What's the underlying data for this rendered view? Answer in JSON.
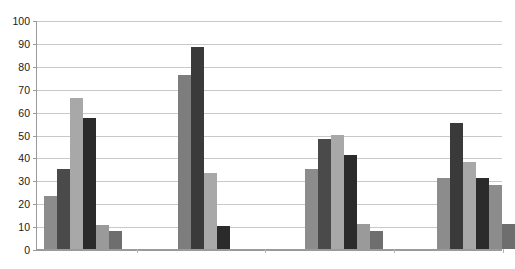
{
  "chart_data": {
    "type": "bar",
    "title": "",
    "subtitle": "",
    "xlabel": "",
    "ylabel": "",
    "ylim": [
      0,
      100
    ],
    "ytick_labels": [
      "100",
      "90",
      "80",
      "70",
      "60",
      "50",
      "40",
      "30",
      "20",
      "10",
      "0"
    ],
    "ytick_values": [
      100,
      90,
      80,
      70,
      60,
      50,
      40,
      30,
      20,
      10,
      0
    ],
    "grid": true,
    "legend": false,
    "legend_position": "none",
    "categories": [
      "Group 1",
      "Group 2",
      "Group 3",
      "Group 4"
    ],
    "xtick_labels": [
      "",
      "",
      "",
      ""
    ],
    "series": [
      {
        "name": "Series 1",
        "color": "#8c8c8c",
        "values": [
          23,
          null,
          35,
          31
        ]
      },
      {
        "name": "Series 2",
        "color": "#4a4a4a",
        "values": [
          35,
          76,
          48,
          55
        ]
      },
      {
        "name": "Series 3",
        "color": "#a8a8a8",
        "values": [
          66,
          88,
          50,
          38
        ]
      },
      {
        "name": "Series 4",
        "color": "#2b2b2b",
        "values": [
          57,
          33,
          41,
          31
        ]
      },
      {
        "name": "Series 5",
        "color": "#9a9a9a",
        "values": [
          10.5,
          10,
          11,
          28
        ]
      },
      {
        "name": "Series 6",
        "color": "#6e6e6e",
        "values": [
          8,
          null,
          8,
          11
        ]
      }
    ],
    "groups": [
      {
        "label": "Group 1",
        "bars": [
          {
            "value": 23,
            "color": "#8c8c8c"
          },
          {
            "value": 35,
            "color": "#4a4a4a"
          },
          {
            "value": 66,
            "color": "#a8a8a8"
          },
          {
            "value": 57,
            "color": "#2b2b2b"
          },
          {
            "value": 10.5,
            "color": "#9a9a9a"
          },
          {
            "value": 8,
            "color": "#6e6e6e"
          }
        ]
      },
      {
        "label": "Group 2",
        "bars": [
          {
            "value": 76,
            "color": "#7d7d7d"
          },
          {
            "value": 88,
            "color": "#3a3a3a"
          },
          {
            "value": 33,
            "color": "#a8a8a8"
          },
          {
            "value": 10,
            "color": "#2b2b2b"
          }
        ]
      },
      {
        "label": "Group 3",
        "bars": [
          {
            "value": 35,
            "color": "#8c8c8c"
          },
          {
            "value": 48,
            "color": "#4a4a4a"
          },
          {
            "value": 50,
            "color": "#a8a8a8"
          },
          {
            "value": 41,
            "color": "#2b2b2b"
          },
          {
            "value": 11,
            "color": "#9a9a9a"
          },
          {
            "value": 8,
            "color": "#6e6e6e"
          }
        ]
      },
      {
        "label": "Group 4",
        "bars": [
          {
            "value": 31,
            "color": "#8c8c8c"
          },
          {
            "value": 55,
            "color": "#3a3a3a"
          },
          {
            "value": 38,
            "color": "#a8a8a8"
          },
          {
            "value": 31,
            "color": "#2b2b2b"
          },
          {
            "value": 28,
            "color": "#8c8c8c"
          },
          {
            "value": 11,
            "color": "#6e6e6e"
          }
        ]
      }
    ],
    "axis_color": "#9a9a9a",
    "gridline_color": "#c9c9c9",
    "background_color": "#ffffff",
    "text_color": "#1a1a1a"
  }
}
